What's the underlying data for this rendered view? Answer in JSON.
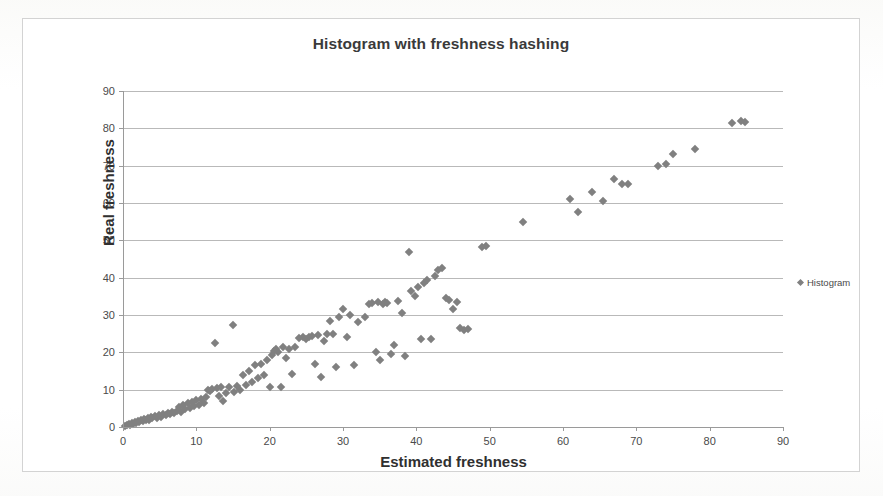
{
  "chart_data": {
    "type": "scatter",
    "title": "Histogram with freshness hashing",
    "xlabel": "Estimated freshness",
    "ylabel": "Real freshness",
    "xlim": [
      0,
      90
    ],
    "ylim": [
      0,
      90
    ],
    "xticks": [
      0,
      10,
      20,
      30,
      40,
      50,
      60,
      70,
      80,
      90
    ],
    "yticks": [
      0,
      10,
      20,
      30,
      40,
      50,
      60,
      70,
      80,
      90
    ],
    "grid": "horizontal",
    "legend_position": "right",
    "marker": "diamond",
    "marker_color": "#808080",
    "series": [
      {
        "name": "Histogram",
        "points": [
          [
            0.3,
            0.4
          ],
          [
            0.6,
            0.5
          ],
          [
            0.8,
            0.9
          ],
          [
            1.0,
            0.6
          ],
          [
            1.2,
            1.1
          ],
          [
            1.4,
            0.8
          ],
          [
            1.6,
            1.4
          ],
          [
            1.8,
            1.0
          ],
          [
            2.0,
            1.6
          ],
          [
            2.2,
            1.3
          ],
          [
            2.5,
            1.9
          ],
          [
            2.7,
            1.5
          ],
          [
            2.9,
            2.1
          ],
          [
            3.1,
            1.8
          ],
          [
            3.4,
            2.4
          ],
          [
            3.6,
            2.0
          ],
          [
            3.8,
            2.6
          ],
          [
            4.0,
            2.3
          ],
          [
            4.3,
            2.9
          ],
          [
            4.6,
            2.5
          ],
          [
            4.9,
            3.2
          ],
          [
            5.2,
            2.8
          ],
          [
            5.5,
            3.5
          ],
          [
            5.8,
            3.1
          ],
          [
            6.1,
            3.8
          ],
          [
            6.4,
            3.4
          ],
          [
            6.7,
            4.1
          ],
          [
            7.0,
            3.7
          ],
          [
            7.3,
            4.4
          ],
          [
            7.6,
            5.4
          ],
          [
            7.9,
            4.0
          ],
          [
            8.2,
            5.8
          ],
          [
            8.5,
            4.7
          ],
          [
            8.8,
            6.3
          ],
          [
            9.1,
            5.1
          ],
          [
            9.4,
            6.8
          ],
          [
            9.7,
            5.5
          ],
          [
            10.0,
            7.2
          ],
          [
            10.3,
            6.0
          ],
          [
            10.6,
            7.6
          ],
          [
            11.0,
            6.4
          ],
          [
            11.3,
            8.0
          ],
          [
            11.6,
            10.0
          ],
          [
            11.9,
            9.6
          ],
          [
            12.2,
            10.2
          ],
          [
            12.5,
            22.5
          ],
          [
            12.8,
            10.4
          ],
          [
            13.1,
            8.4
          ],
          [
            13.4,
            10.6
          ],
          [
            13.7,
            7.0
          ],
          [
            14.0,
            9.0
          ],
          [
            14.5,
            10.8
          ],
          [
            15.0,
            27.2
          ],
          [
            15.2,
            9.4
          ],
          [
            15.6,
            11.0
          ],
          [
            16.0,
            10.0
          ],
          [
            16.4,
            14.0
          ],
          [
            16.8,
            11.2
          ],
          [
            17.2,
            15.0
          ],
          [
            17.6,
            12.0
          ],
          [
            18.0,
            16.5
          ],
          [
            18.4,
            13.0
          ],
          [
            18.8,
            17.0
          ],
          [
            19.2,
            13.8
          ],
          [
            19.6,
            18.0
          ],
          [
            20.0,
            10.8
          ],
          [
            20.3,
            19.2
          ],
          [
            20.6,
            20.4
          ],
          [
            20.9,
            21.0
          ],
          [
            21.2,
            20.0
          ],
          [
            21.5,
            10.6
          ],
          [
            21.8,
            21.4
          ],
          [
            22.2,
            18.5
          ],
          [
            22.6,
            20.8
          ],
          [
            23.0,
            14.2
          ],
          [
            23.5,
            21.5
          ],
          [
            24.0,
            23.8
          ],
          [
            24.5,
            24.2
          ],
          [
            25.0,
            23.5
          ],
          [
            25.4,
            24.0
          ],
          [
            25.8,
            24.4
          ],
          [
            26.2,
            17.0
          ],
          [
            26.6,
            24.6
          ],
          [
            27.0,
            13.5
          ],
          [
            27.4,
            23.0
          ],
          [
            27.8,
            24.8
          ],
          [
            28.2,
            28.5
          ],
          [
            28.6,
            25.0
          ],
          [
            29.0,
            16.0
          ],
          [
            29.5,
            29.5
          ],
          [
            30.0,
            31.5
          ],
          [
            30.5,
            24.0
          ],
          [
            31.0,
            30.0
          ],
          [
            31.5,
            16.5
          ],
          [
            32.0,
            28.0
          ],
          [
            33.0,
            29.5
          ],
          [
            33.5,
            33.0
          ],
          [
            34.0,
            33.2
          ],
          [
            34.5,
            20.0
          ],
          [
            34.8,
            33.4
          ],
          [
            35.1,
            18.0
          ],
          [
            35.4,
            33.0
          ],
          [
            35.7,
            33.6
          ],
          [
            36.0,
            33.2
          ],
          [
            36.5,
            19.5
          ],
          [
            37.0,
            22.0
          ],
          [
            37.5,
            33.8
          ],
          [
            38.0,
            30.5
          ],
          [
            38.5,
            19.0
          ],
          [
            39.0,
            47.0
          ],
          [
            39.3,
            36.5
          ],
          [
            39.8,
            35.0
          ],
          [
            40.2,
            37.5
          ],
          [
            40.6,
            23.5
          ],
          [
            41.0,
            38.5
          ],
          [
            41.5,
            39.5
          ],
          [
            42.0,
            23.5
          ],
          [
            42.5,
            40.5
          ],
          [
            43.0,
            42.0
          ],
          [
            43.5,
            42.5
          ],
          [
            44.0,
            34.5
          ],
          [
            44.5,
            34.0
          ],
          [
            45.0,
            31.5
          ],
          [
            45.5,
            33.5
          ],
          [
            46.0,
            26.5
          ],
          [
            46.5,
            26.0
          ],
          [
            47.0,
            26.2
          ],
          [
            49.0,
            48.2
          ],
          [
            49.5,
            48.6
          ],
          [
            54.5,
            55.0
          ],
          [
            61.0,
            61.0
          ],
          [
            62.0,
            57.5
          ],
          [
            64.0,
            63.0
          ],
          [
            65.5,
            60.5
          ],
          [
            67.0,
            66.5
          ],
          [
            68.0,
            65.0
          ],
          [
            68.8,
            65.2
          ],
          [
            73.0,
            70.0
          ],
          [
            74.0,
            70.5
          ],
          [
            75.0,
            73.0
          ],
          [
            78.0,
            74.5
          ],
          [
            83.0,
            81.5
          ],
          [
            84.3,
            82.0
          ],
          [
            84.8,
            81.8
          ]
        ]
      }
    ],
    "legend": [
      {
        "label": "Histogram",
        "color": "#808080"
      }
    ]
  }
}
